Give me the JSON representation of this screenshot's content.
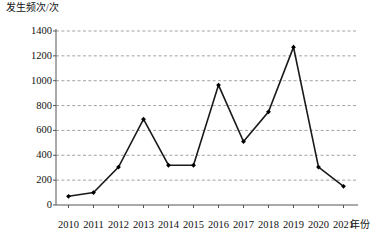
{
  "chart_data": {
    "type": "line",
    "title": "",
    "ylabel": "发生频次/次",
    "xlabel": "年份",
    "categories": [
      "2010",
      "2011",
      "2012",
      "2013",
      "2014",
      "2015",
      "2016",
      "2017",
      "2018",
      "2019",
      "2020",
      "2021"
    ],
    "values": [
      70,
      100,
      305,
      690,
      320,
      320,
      965,
      510,
      750,
      1270,
      305,
      150
    ],
    "series": [
      {
        "name": "发生频次",
        "values": [
          70,
          100,
          305,
          690,
          320,
          320,
          965,
          510,
          750,
          1270,
          305,
          150
        ]
      }
    ],
    "ylim": [
      0,
      1400
    ],
    "yticks": [
      0,
      200,
      400,
      600,
      800,
      1000,
      1200,
      1400
    ],
    "ytick_labels": [
      "0",
      "200",
      "400",
      "600",
      "800",
      "1000",
      "1200",
      "1400"
    ],
    "grid": "horizontal-dashed",
    "legend": "none",
    "line_color": "#1a1a1a",
    "marker_color": "#000000",
    "marker_shape": "diamond",
    "grid_color": "#8a8a8a",
    "axis_color": "#555555"
  }
}
